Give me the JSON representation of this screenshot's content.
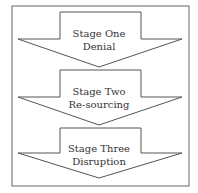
{
  "diagram": {
    "type": "stage-flow",
    "stages": [
      {
        "title": "Stage One",
        "subtitle": "Denial"
      },
      {
        "title": "Stage Two",
        "subtitle": "Re-sourcing"
      },
      {
        "title": "Stage Three",
        "subtitle": "Disruption"
      }
    ],
    "colors": {
      "stroke": "#555555",
      "fill": "#ffffff",
      "text": "#333333"
    }
  }
}
